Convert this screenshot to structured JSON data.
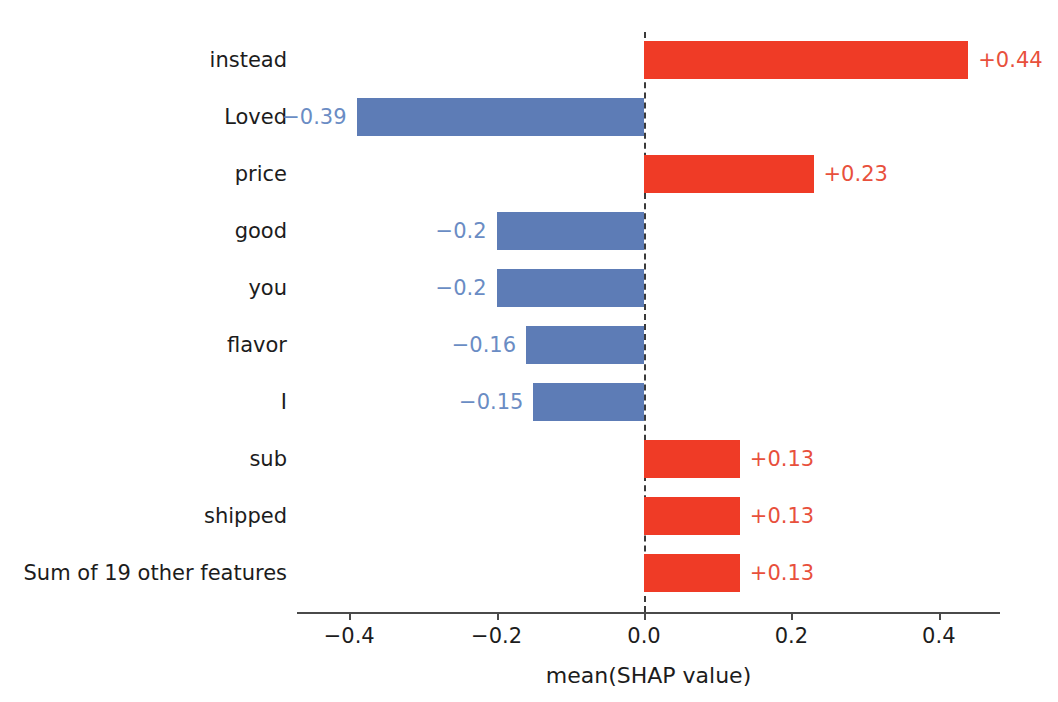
{
  "figure": {
    "clipped_header_text": "",
    "background_color": "#ffffff"
  },
  "chart_data": {
    "type": "bar",
    "orientation": "horizontal",
    "title": "",
    "xlabel": "mean(SHAP value)",
    "ylabel": "",
    "xlim": [
      -0.475,
      0.48
    ],
    "xticks": [
      -0.4,
      -0.2,
      0.0,
      0.2,
      0.4
    ],
    "xticklabels": [
      "−0.4",
      "−0.2",
      "0.0",
      "0.2",
      "0.4"
    ],
    "grid": false,
    "legend": null,
    "zero_reference_line": 0.0,
    "positive_color": "#ef3b26",
    "negative_color": "#5d7cb6",
    "positive_label_color": "#e8503c",
    "negative_label_color": "#6a8cc4",
    "categories": [
      "instead",
      "Loved",
      "price",
      "good",
      "you",
      "flavor",
      "I",
      "sub",
      "shipped",
      "Sum of 19 other features"
    ],
    "values": [
      0.44,
      -0.39,
      0.23,
      -0.2,
      -0.2,
      -0.16,
      -0.15,
      0.13,
      0.13,
      0.13
    ],
    "value_labels": [
      "+0.44",
      "−0.39",
      "+0.23",
      "−0.2",
      "−0.2",
      "−0.16",
      "−0.15",
      "+0.13",
      "+0.13",
      "+0.13"
    ],
    "bars": [
      {
        "category": "instead",
        "value": 0.44,
        "label": "+0.44",
        "sign": "pos"
      },
      {
        "category": "Loved",
        "value": -0.39,
        "label": "−0.39",
        "sign": "neg"
      },
      {
        "category": "price",
        "value": 0.23,
        "label": "+0.23",
        "sign": "pos"
      },
      {
        "category": "good",
        "value": -0.2,
        "label": "−0.2",
        "sign": "neg"
      },
      {
        "category": "you",
        "value": -0.2,
        "label": "−0.2",
        "sign": "neg"
      },
      {
        "category": "flavor",
        "value": -0.16,
        "label": "−0.16",
        "sign": "neg"
      },
      {
        "category": "I",
        "value": -0.15,
        "label": "−0.15",
        "sign": "neg"
      },
      {
        "category": "sub",
        "value": 0.13,
        "label": "+0.13",
        "sign": "pos"
      },
      {
        "category": "shipped",
        "value": 0.13,
        "label": "+0.13",
        "sign": "pos"
      },
      {
        "category": "Sum of 19 other features",
        "value": 0.13,
        "label": "+0.13",
        "sign": "pos"
      }
    ]
  }
}
